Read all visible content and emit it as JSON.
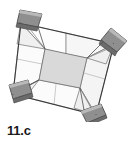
{
  "figure": {
    "caption": "11.c",
    "type": "geometric-folding-diagram",
    "colors": {
      "background": "#ffffff",
      "stroke": "#3a3a3a",
      "fold_line": "#9a9a9a",
      "panel_white": "#fdfdfd",
      "panel_light": "#f2f2f2",
      "center_square": "#d8d8d8",
      "corner_flap": "#8c8c8c",
      "corner_flap_edge": "#6f6f6f",
      "corner_flap_light": "#b5b5b5",
      "caption_text": "#1a1a1a"
    },
    "geometry": {
      "outer_quad": [
        [
          21,
          23
        ],
        [
          114,
          44
        ],
        [
          96,
          115
        ],
        [
          13,
          94
        ]
      ],
      "inner_quad": [
        [
          45,
          49
        ],
        [
          87,
          58
        ],
        [
          80,
          88
        ],
        [
          39,
          80
        ]
      ],
      "corner_flaps": [
        {
          "name": "top-left",
          "points": [
            [
              20,
              10
            ],
            [
              41,
              14
            ],
            [
              37,
              28
            ],
            [
              17,
              24
            ]
          ]
        },
        {
          "name": "top-right",
          "points": [
            [
              110,
              30
            ],
            [
              127,
              43
            ],
            [
              116,
              54
            ],
            [
              100,
              42
            ]
          ]
        },
        {
          "name": "bottom-left",
          "points": [
            [
              10,
              86
            ],
            [
              28,
              82
            ],
            [
              32,
              96
            ],
            [
              13,
              100
            ]
          ]
        },
        {
          "name": "bottom-right",
          "points": [
            [
              82,
              114
            ],
            [
              101,
              106
            ],
            [
              106,
              118
            ],
            [
              88,
              127
            ]
          ]
        }
      ]
    }
  }
}
